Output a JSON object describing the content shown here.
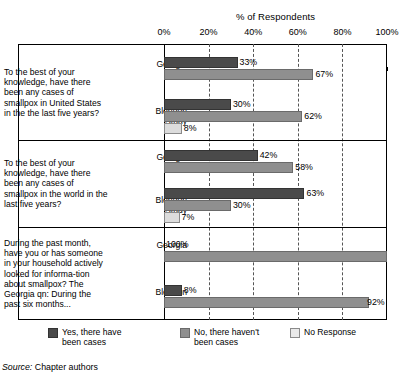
{
  "chart_data": {
    "type": "bar",
    "orientation": "horizontal",
    "title": "% of Respondents",
    "xlabel": "% of Respondents",
    "ylabel": "",
    "xlim": [
      0,
      100
    ],
    "xticks": [
      "0%",
      "20%",
      "40%",
      "60%",
      "80%",
      "100%"
    ],
    "xtick_values": [
      0,
      20,
      40,
      60,
      80,
      100
    ],
    "grid": "vertical-dashed",
    "legend_position": "bottom",
    "legend": [
      "Yes, there have\nbeen cases",
      "No, there haven't\nbeen cases",
      "No Response"
    ],
    "series": [
      {
        "name": "Yes, there have been cases",
        "color": "#4a4a4a"
      },
      {
        "name": "No, there haven't been cases",
        "color": "#8f8f8f"
      },
      {
        "name": "No Response",
        "color": "#dcdcdc"
      }
    ],
    "groups": [
      {
        "question": "To the best of your knowledge, have there been any cases of smallpox in United States in the the last five years?",
        "rows": [
          {
            "label": "Georgia\nTech",
            "bars": [
              {
                "series": "Yes, there have been cases",
                "value": 33,
                "label": "33%"
              },
              {
                "series": "No, there haven't been cases",
                "value": 67,
                "label": "67%"
              }
            ]
          },
          {
            "label": "Blendon\nStudy",
            "bars": [
              {
                "series": "Yes, there have been cases",
                "value": 30,
                "label": "30%"
              },
              {
                "series": "No, there haven't been cases",
                "value": 62,
                "label": "62%"
              },
              {
                "series": "No Response",
                "value": 8,
                "label": "8%"
              }
            ]
          }
        ]
      },
      {
        "question": "To the best of your knowledge, have there been any cases of smallpox in the world in the last five years?",
        "rows": [
          {
            "label": "Georgia\nTech",
            "bars": [
              {
                "series": "Yes, there have been cases",
                "value": 42,
                "label": "42%"
              },
              {
                "series": "No, there haven't been cases",
                "value": 58,
                "label": "58%"
              }
            ]
          },
          {
            "label": "Blendon\nStudy",
            "bars": [
              {
                "series": "Yes, there have been cases",
                "value": 63,
                "label": "63%"
              },
              {
                "series": "No, there haven't been cases",
                "value": 30,
                "label": "30%"
              },
              {
                "series": "No Response",
                "value": 7,
                "label": "7%"
              }
            ]
          }
        ]
      },
      {
        "question": "During the past month, have you or has someone in your household actively looked for informa-tion about smallpox? The Georgia qn: During the past six months...",
        "rows": [
          {
            "label": "Georgia\nTech",
            "bars": [
              {
                "series": "Yes, there have been cases",
                "value": 0,
                "label": "100%"
              },
              {
                "series": "No, there haven't been cases",
                "value": 100,
                "label": ""
              }
            ]
          },
          {
            "label": "Blendon\nStudy",
            "bars": [
              {
                "series": "Yes, there have been cases",
                "value": 8,
                "label": "8%"
              },
              {
                "series": "No, there haven't been cases",
                "value": 92,
                "label": "92%"
              }
            ]
          }
        ]
      }
    ]
  },
  "source": {
    "label": "Source:",
    "text": "Chapter authors"
  }
}
